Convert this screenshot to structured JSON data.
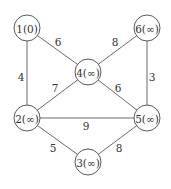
{
  "diagram": {
    "type": "weighted-undirected-graph",
    "colors": {
      "edge": "#6a6a6a",
      "node_stroke": "#5a5a5a",
      "text": "#333333",
      "background": "#ffffff"
    },
    "nodes": [
      {
        "id": "1",
        "label": "1(0)",
        "x": 27,
        "y": 28
      },
      {
        "id": "6",
        "label": "6(∞)",
        "x": 147,
        "y": 28
      },
      {
        "id": "4",
        "label": "4(∞)",
        "x": 88,
        "y": 72
      },
      {
        "id": "2",
        "label": "2(∞)",
        "x": 27,
        "y": 118
      },
      {
        "id": "5",
        "label": "5(∞)",
        "x": 147,
        "y": 118
      },
      {
        "id": "3",
        "label": "3(∞)",
        "x": 88,
        "y": 162
      }
    ],
    "node_radius": 13,
    "edges": [
      {
        "from": "1",
        "to": "4",
        "weight": "6",
        "lx": 58,
        "ly": 42
      },
      {
        "from": "6",
        "to": "4",
        "weight": "8",
        "lx": 115,
        "ly": 42
      },
      {
        "from": "1",
        "to": "2",
        "weight": "4",
        "lx": 21,
        "ly": 77
      },
      {
        "from": "6",
        "to": "5",
        "weight": "3",
        "lx": 152,
        "ly": 77
      },
      {
        "from": "4",
        "to": "2",
        "weight": "7",
        "lx": 55,
        "ly": 88
      },
      {
        "from": "4",
        "to": "5",
        "weight": "6",
        "lx": 118,
        "ly": 88
      },
      {
        "from": "2",
        "to": "5",
        "weight": "9",
        "lx": 86,
        "ly": 126
      },
      {
        "from": "2",
        "to": "3",
        "weight": "5",
        "lx": 53,
        "ly": 148
      },
      {
        "from": "5",
        "to": "3",
        "weight": "8",
        "lx": 119,
        "ly": 148
      }
    ]
  }
}
